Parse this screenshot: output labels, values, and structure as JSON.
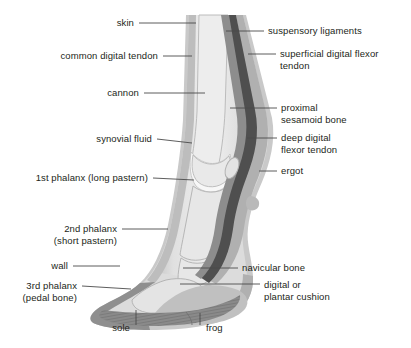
{
  "figure": {
    "background_color": "#ffffff",
    "line_color": "#4b4b4b",
    "text_color": "#231f20",
    "palette": {
      "skin_outer": "#c9c9c9",
      "subcutaneous": "#dcdcdc",
      "bone_light": "#ededed",
      "bone_fill": "#e4e4e4",
      "bone_outline": "#b4b4b4",
      "tendon_mid": "#9a9a9a",
      "tendon_dark": "#575757",
      "tendon_darkest": "#444444",
      "hoof_wall": "#8f8f8f",
      "sole_frog": "#8a8a8a",
      "cushion": "#bdbdbd",
      "synovial": "#f3f3f3"
    }
  },
  "labels": {
    "left": [
      {
        "id": "skin",
        "text": "skin"
      },
      {
        "id": "common-digital-tendon",
        "text": "common digital tendon"
      },
      {
        "id": "cannon",
        "text": "cannon"
      },
      {
        "id": "synovial-fluid",
        "text": "synovial fluid"
      },
      {
        "id": "first-phalanx",
        "text": "1st phalanx (long pastern)"
      },
      {
        "id": "second-phalanx",
        "text": "2nd phalanx\n(short pastern)"
      },
      {
        "id": "wall",
        "text": "wall"
      },
      {
        "id": "third-phalanx",
        "text": "3rd phalanx\n(pedal bone)"
      }
    ],
    "right": [
      {
        "id": "suspensory-ligaments",
        "text": "suspensory ligaments"
      },
      {
        "id": "superficial-digital-flexor-tendon",
        "text": "superficial digital flexor\ntendon"
      },
      {
        "id": "proximal-sesamoid-bone",
        "text": "proximal\nsesamoid bone"
      },
      {
        "id": "deep-digital-flexor-tendon",
        "text": "deep digital\nflexor tendon"
      },
      {
        "id": "ergot",
        "text": "ergot"
      },
      {
        "id": "navicular-bone",
        "text": "navicular bone"
      },
      {
        "id": "digital-or-plantar-cushion",
        "text": "digital or\nplantar cushion"
      }
    ],
    "bottom": [
      {
        "id": "sole",
        "text": "sole"
      },
      {
        "id": "frog",
        "text": "frog"
      }
    ]
  }
}
